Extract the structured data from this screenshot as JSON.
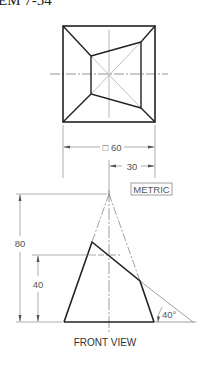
{
  "problem_title": "EM 7-54",
  "top_view": {
    "outer_square": {
      "x1": 63,
      "y1": 26,
      "x2": 155,
      "y2": 122
    },
    "inner_quad": [
      [
        91,
        56
      ],
      [
        141,
        42
      ],
      [
        141,
        108
      ],
      [
        91,
        94
      ]
    ]
  },
  "dimensions": {
    "square_size": "□ 60",
    "offset": "30",
    "height_total": "80",
    "height_cut": "40",
    "angle": "40°"
  },
  "units_badge": "METRIC",
  "front_view_label": "FRONT VIEW",
  "colors": {
    "object_line": "#222222",
    "thin_line": "#777777",
    "background": "#ffffff"
  }
}
